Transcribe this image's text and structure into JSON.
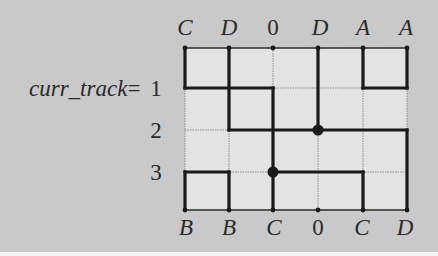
{
  "diagram": {
    "type": "channel-routing",
    "track_label": {
      "variable": "curr_track",
      "equals": "=",
      "tracks": [
        "1",
        "2",
        "3"
      ]
    },
    "top_pins": [
      "C",
      "D",
      "0",
      "D",
      "A",
      "A"
    ],
    "bottom_pins": [
      "B",
      "B",
      "C",
      "0",
      "C",
      "D"
    ],
    "grid": {
      "columns_x": [
        185,
        229,
        273,
        318,
        363,
        407
      ],
      "rows_y": [
        48,
        88,
        130,
        172,
        210
      ],
      "cell_fill": "#e3e3e3",
      "grid_line_color": "#8a8a8a",
      "wire_color": "#1a1a1a"
    },
    "nets": [
      {
        "name": "C",
        "segments": [
          [
            0,
            0,
            0,
            1
          ],
          [
            0,
            1,
            2,
            1
          ],
          [
            2,
            1,
            2,
            3
          ],
          [
            2,
            3,
            2,
            4
          ],
          [
            2,
            3,
            4,
            3
          ],
          [
            4,
            3,
            4,
            4
          ]
        ]
      },
      {
        "name": "D",
        "segments": [
          [
            1,
            0,
            1,
            2
          ],
          [
            1,
            2,
            5,
            2
          ],
          [
            3,
            0,
            3,
            2
          ],
          [
            5,
            2,
            5,
            4
          ]
        ]
      },
      {
        "name": "A",
        "segments": [
          [
            4,
            0,
            4,
            1
          ],
          [
            4,
            1,
            5,
            1
          ],
          [
            5,
            1,
            5,
            0
          ]
        ]
      },
      {
        "name": "B",
        "segments": [
          [
            0,
            3,
            0,
            4
          ],
          [
            0,
            3,
            1,
            3
          ],
          [
            1,
            3,
            1,
            4
          ]
        ]
      }
    ],
    "junctions": [
      [
        3,
        2
      ],
      [
        2,
        3
      ]
    ],
    "pin_dots_top": [
      0,
      1,
      2,
      3,
      4,
      5
    ],
    "pin_dots_bottom": [
      0,
      1,
      2,
      3,
      4,
      5
    ]
  }
}
